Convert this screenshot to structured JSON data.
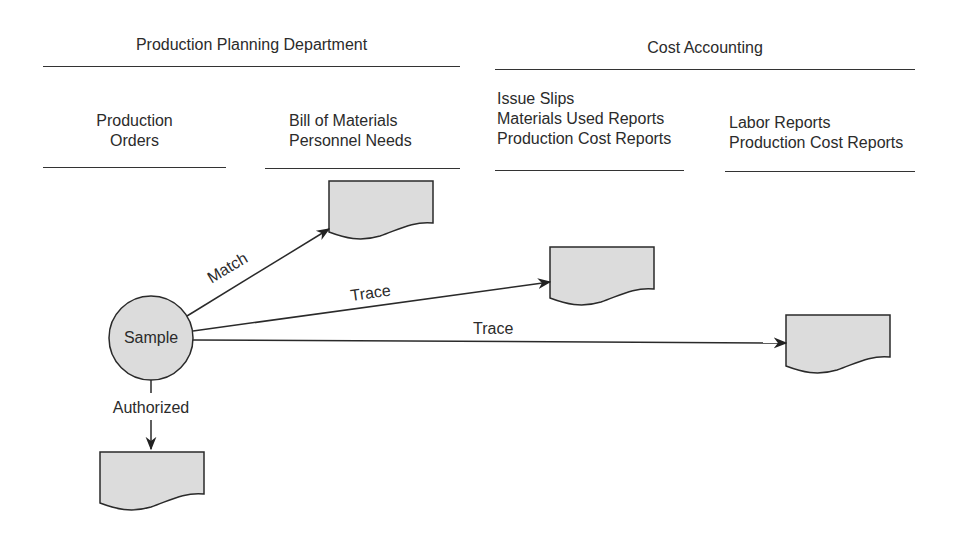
{
  "departments": [
    {
      "title": "Production Planning Department",
      "columns": [
        {
          "lines": [
            "Production",
            "Orders"
          ]
        },
        {
          "lines": [
            "Bill of Materials",
            "Personnel Needs"
          ]
        }
      ]
    },
    {
      "title": "Cost Accounting",
      "columns": [
        {
          "lines": [
            "Issue Slips",
            "Materials Used Reports",
            "Production Cost Reports"
          ]
        },
        {
          "lines": [
            "Labor Reports",
            "Production Cost Reports"
          ]
        }
      ]
    }
  ],
  "nodes": {
    "sample": {
      "label": "Sample"
    }
  },
  "edges": [
    {
      "label": "Match",
      "from": "sample",
      "to": "bill-of-materials-document"
    },
    {
      "label": "Trace",
      "from": "sample",
      "to": "issue-slips-document"
    },
    {
      "label": "Trace",
      "from": "sample",
      "to": "labor-reports-document"
    },
    {
      "label": "Authorized",
      "from": "sample",
      "to": "production-orders-document"
    }
  ],
  "colors": {
    "shape_fill": "#dcdcdc",
    "stroke": "#2a2a2a",
    "text": "#2b2b2b"
  }
}
